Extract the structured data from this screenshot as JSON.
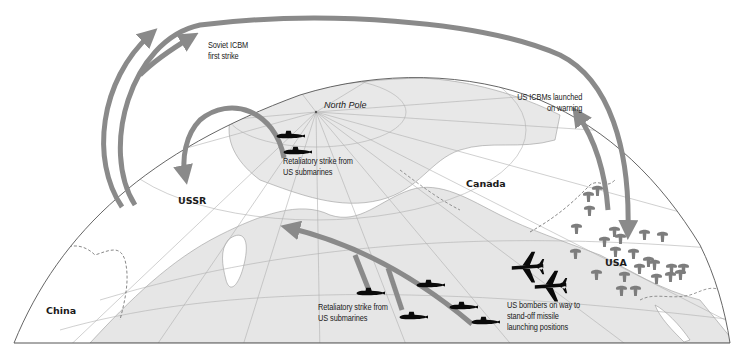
{
  "diagram": {
    "title": "",
    "colors": {
      "land": "#e8e8e8",
      "land_outline": "#9a9a9a",
      "grid": "#b0b0b0",
      "arrow": "#8a8a8a",
      "mushroom": "#7d7d7d",
      "silhouette": "#0a0a0a",
      "globe_outline": "#555555",
      "background": "#ffffff"
    },
    "regions": {
      "ussr": "USSR",
      "canada": "Canada",
      "china": "China",
      "usa": "USA",
      "north_pole": "North Pole"
    },
    "annotations": {
      "soviet_first_strike": [
        "Soviet ICBM",
        "first strike"
      ],
      "us_icbms_warning": [
        "US ICBMs launched",
        "on warning"
      ],
      "retaliatory_north": [
        "Retaliatory strike from",
        "US submarines"
      ],
      "retaliatory_pacific": [
        "Retaliatory strike from",
        "US submarines"
      ],
      "us_bombers": [
        "US bombers on way to",
        "stand-off missile",
        "launching positions"
      ]
    },
    "icons": {
      "submarine": "submarine-icon",
      "bomber": "bomber-icon",
      "mushroom_cloud": "mushroom-cloud-icon",
      "arrow": "missile-arrow-icon"
    },
    "counts": {
      "submarines_arctic": 2,
      "submarines_pacific": 5,
      "bombers": 2,
      "mushroom_clouds_usa": 24
    }
  }
}
